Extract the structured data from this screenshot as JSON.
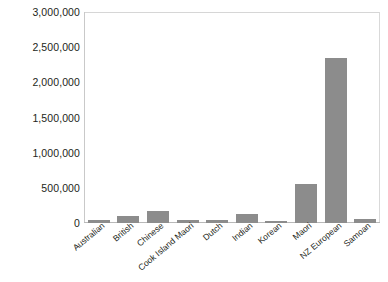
{
  "chart_data": {
    "type": "bar",
    "title": "",
    "xlabel": "",
    "ylabel": "",
    "categories": [
      "Australian",
      "British",
      "Chinese",
      "Cook Island Maori",
      "Dutch",
      "Indian",
      "Korean",
      "Maori",
      "NZ European",
      "Samoan"
    ],
    "values": [
      40000,
      100000,
      172000,
      40000,
      40000,
      129000,
      35000,
      560000,
      2340000,
      50000
    ],
    "ylim": [
      0,
      3000000
    ],
    "ytick_labels": [
      "3,000,000",
      "2,500,000",
      "2,000,000",
      "1,500,000",
      "1,000,000",
      "500,000",
      "0"
    ],
    "ytick_values": [
      3000000,
      2500000,
      2000000,
      1500000,
      1000000,
      500000,
      0
    ],
    "grid": false,
    "legend": null,
    "bar_color": "#8c8c8c",
    "frame_color": "#d6d6d6",
    "text_color": "#231f20",
    "background_color": "#ffffff"
  }
}
